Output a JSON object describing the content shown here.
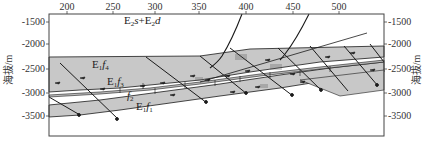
{
  "figure": {
    "type": "geological-cross-section",
    "top_axis": {
      "ticks": [
        "200",
        "250",
        "300",
        "350",
        "400",
        "450",
        "500"
      ]
    },
    "left_axis": {
      "label": "海拔/m",
      "ticks": [
        "-1500",
        "-2000",
        "-2500",
        "-3000",
        "-3500"
      ]
    },
    "right_axis": {
      "label": "海拔/m",
      "ticks": [
        "-1500",
        "-2000",
        "-2500",
        "-3000",
        "-3500"
      ]
    },
    "formations": {
      "top": {
        "base1": "E",
        "sub1": "2",
        "it1": "s",
        "plus": "+",
        "base2": "E",
        "sub2": "2",
        "it2": "d"
      },
      "f4": {
        "base": "E",
        "sub": "1",
        "it": "f",
        "sub2": "4"
      },
      "f3": {
        "base": "E",
        "sub": "1",
        "it": "f",
        "sub2": "3"
      },
      "f2": {
        "base": "",
        "sub": "",
        "it": "f",
        "sub2": "2"
      },
      "f1": {
        "base": "E",
        "sub": "1",
        "it": "f",
        "sub2": "1"
      }
    },
    "colors": {
      "layer_fill": "#c8c8c8",
      "line": "#1a1a1a",
      "frame": "#444444",
      "background": "#ffffff"
    }
  }
}
